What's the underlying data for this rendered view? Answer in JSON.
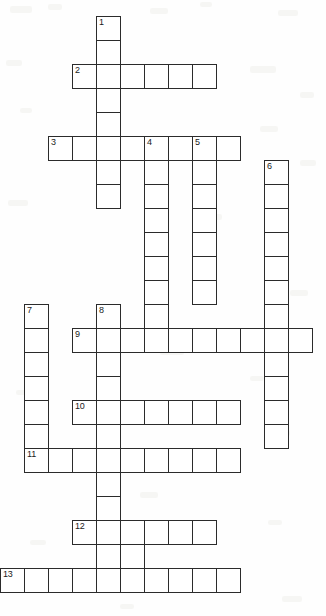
{
  "puzzle": {
    "kind": "crossword-grid",
    "title": "",
    "cell_size_px": 24,
    "origin": {
      "x": 0,
      "y": 16
    },
    "grid_columns": 14,
    "grid_rows": 25,
    "colors": {
      "cell_fill": "#ffffff",
      "cell_border": "#2b2b2b",
      "page_background": "#ffffff",
      "number_text": "#1b1b1b"
    },
    "entries": [
      {
        "number": "1",
        "direction": "down",
        "start_col": 4,
        "start_row": 0,
        "length": 13
      },
      {
        "number": "2",
        "direction": "across",
        "start_col": 3,
        "start_row": 2,
        "length": 6
      },
      {
        "number": "3",
        "direction": "across",
        "start_col": 2,
        "start_row": 5,
        "length": 8
      },
      {
        "number": "4",
        "direction": "down",
        "start_col": 6,
        "start_row": 5,
        "length": 13
      },
      {
        "number": "5",
        "direction": "down",
        "start_col": 8,
        "start_row": 5,
        "length": 7
      },
      {
        "number": "6",
        "direction": "down",
        "start_col": 11,
        "start_row": 6,
        "length": 11
      },
      {
        "number": "7",
        "direction": "down",
        "start_col": 1,
        "start_row": 12,
        "length": 7
      },
      {
        "number": "8",
        "direction": "down",
        "start_col": 4,
        "start_row": 12,
        "length": 10
      },
      {
        "number": "9",
        "direction": "across",
        "start_col": 3,
        "start_row": 13,
        "length": 10
      },
      {
        "number": "10",
        "direction": "across",
        "start_col": 3,
        "start_row": 16,
        "length": 7
      },
      {
        "number": "11",
        "direction": "across",
        "start_col": 1,
        "start_row": 18,
        "length": 9
      },
      {
        "number": "12",
        "direction": "across",
        "start_col": 3,
        "start_row": 21,
        "length": 6
      },
      {
        "number": "13",
        "direction": "across",
        "start_col": 0,
        "start_row": 23,
        "length": 10
      }
    ],
    "cells": [
      {
        "col": 4,
        "row": 0,
        "number": "1"
      },
      {
        "col": 4,
        "row": 1,
        "number": ""
      },
      {
        "col": 3,
        "row": 2,
        "number": "2"
      },
      {
        "col": 4,
        "row": 2,
        "number": ""
      },
      {
        "col": 5,
        "row": 2,
        "number": ""
      },
      {
        "col": 6,
        "row": 2,
        "number": ""
      },
      {
        "col": 7,
        "row": 2,
        "number": ""
      },
      {
        "col": 8,
        "row": 2,
        "number": ""
      },
      {
        "col": 4,
        "row": 3,
        "number": ""
      },
      {
        "col": 4,
        "row": 4,
        "number": ""
      },
      {
        "col": 2,
        "row": 5,
        "number": "3"
      },
      {
        "col": 3,
        "row": 5,
        "number": ""
      },
      {
        "col": 4,
        "row": 5,
        "number": ""
      },
      {
        "col": 5,
        "row": 5,
        "number": ""
      },
      {
        "col": 6,
        "row": 5,
        "number": "4"
      },
      {
        "col": 7,
        "row": 5,
        "number": ""
      },
      {
        "col": 8,
        "row": 5,
        "number": "5"
      },
      {
        "col": 9,
        "row": 5,
        "number": ""
      },
      {
        "col": 4,
        "row": 6,
        "number": ""
      },
      {
        "col": 6,
        "row": 6,
        "number": ""
      },
      {
        "col": 8,
        "row": 6,
        "number": ""
      },
      {
        "col": 11,
        "row": 6,
        "number": "6"
      },
      {
        "col": 4,
        "row": 7,
        "number": ""
      },
      {
        "col": 6,
        "row": 7,
        "number": ""
      },
      {
        "col": 8,
        "row": 7,
        "number": ""
      },
      {
        "col": 11,
        "row": 7,
        "number": ""
      },
      {
        "col": 6,
        "row": 8,
        "number": ""
      },
      {
        "col": 8,
        "row": 8,
        "number": ""
      },
      {
        "col": 11,
        "row": 8,
        "number": ""
      },
      {
        "col": 6,
        "row": 9,
        "number": ""
      },
      {
        "col": 8,
        "row": 9,
        "number": ""
      },
      {
        "col": 11,
        "row": 9,
        "number": ""
      },
      {
        "col": 6,
        "row": 10,
        "number": ""
      },
      {
        "col": 8,
        "row": 10,
        "number": ""
      },
      {
        "col": 11,
        "row": 10,
        "number": ""
      },
      {
        "col": 6,
        "row": 11,
        "number": ""
      },
      {
        "col": 8,
        "row": 11,
        "number": ""
      },
      {
        "col": 11,
        "row": 11,
        "number": ""
      },
      {
        "col": 1,
        "row": 12,
        "number": "7"
      },
      {
        "col": 4,
        "row": 12,
        "number": "8"
      },
      {
        "col": 6,
        "row": 12,
        "number": ""
      },
      {
        "col": 11,
        "row": 12,
        "number": ""
      },
      {
        "col": 3,
        "row": 13,
        "number": "9"
      },
      {
        "col": 4,
        "row": 13,
        "number": ""
      },
      {
        "col": 5,
        "row": 13,
        "number": ""
      },
      {
        "col": 6,
        "row": 13,
        "number": ""
      },
      {
        "col": 7,
        "row": 13,
        "number": ""
      },
      {
        "col": 8,
        "row": 13,
        "number": ""
      },
      {
        "col": 9,
        "row": 13,
        "number": ""
      },
      {
        "col": 10,
        "row": 13,
        "number": ""
      },
      {
        "col": 11,
        "row": 13,
        "number": ""
      },
      {
        "col": 12,
        "row": 13,
        "number": ""
      },
      {
        "col": 1,
        "row": 13,
        "number": ""
      },
      {
        "col": 1,
        "row": 14,
        "number": ""
      },
      {
        "col": 4,
        "row": 14,
        "number": ""
      },
      {
        "col": 11,
        "row": 14,
        "number": ""
      },
      {
        "col": 1,
        "row": 15,
        "number": ""
      },
      {
        "col": 4,
        "row": 15,
        "number": ""
      },
      {
        "col": 11,
        "row": 15,
        "number": ""
      },
      {
        "col": 1,
        "row": 16,
        "number": ""
      },
      {
        "col": 3,
        "row": 16,
        "number": "10"
      },
      {
        "col": 4,
        "row": 16,
        "number": ""
      },
      {
        "col": 5,
        "row": 16,
        "number": ""
      },
      {
        "col": 6,
        "row": 16,
        "number": ""
      },
      {
        "col": 7,
        "row": 16,
        "number": ""
      },
      {
        "col": 8,
        "row": 16,
        "number": ""
      },
      {
        "col": 9,
        "row": 16,
        "number": ""
      },
      {
        "col": 11,
        "row": 16,
        "number": ""
      },
      {
        "col": 1,
        "row": 17,
        "number": ""
      },
      {
        "col": 4,
        "row": 17,
        "number": ""
      },
      {
        "col": 11,
        "row": 17,
        "number": ""
      },
      {
        "col": 1,
        "row": 18,
        "number": "11"
      },
      {
        "col": 2,
        "row": 18,
        "number": ""
      },
      {
        "col": 3,
        "row": 18,
        "number": ""
      },
      {
        "col": 4,
        "row": 18,
        "number": ""
      },
      {
        "col": 5,
        "row": 18,
        "number": ""
      },
      {
        "col": 6,
        "row": 18,
        "number": ""
      },
      {
        "col": 7,
        "row": 18,
        "number": ""
      },
      {
        "col": 8,
        "row": 18,
        "number": ""
      },
      {
        "col": 9,
        "row": 18,
        "number": ""
      },
      {
        "col": 4,
        "row": 19,
        "number": ""
      },
      {
        "col": 4,
        "row": 20,
        "number": ""
      },
      {
        "col": 3,
        "row": 21,
        "number": "12"
      },
      {
        "col": 4,
        "row": 21,
        "number": ""
      },
      {
        "col": 5,
        "row": 21,
        "number": ""
      },
      {
        "col": 6,
        "row": 21,
        "number": ""
      },
      {
        "col": 7,
        "row": 21,
        "number": ""
      },
      {
        "col": 8,
        "row": 21,
        "number": ""
      },
      {
        "col": 4,
        "row": 22,
        "number": ""
      },
      {
        "col": 5,
        "row": 22,
        "number": ""
      },
      {
        "col": 0,
        "row": 23,
        "number": "13"
      },
      {
        "col": 1,
        "row": 23,
        "number": ""
      },
      {
        "col": 2,
        "row": 23,
        "number": ""
      },
      {
        "col": 3,
        "row": 23,
        "number": ""
      },
      {
        "col": 4,
        "row": 23,
        "number": ""
      },
      {
        "col": 5,
        "row": 23,
        "number": ""
      },
      {
        "col": 6,
        "row": 23,
        "number": ""
      },
      {
        "col": 7,
        "row": 23,
        "number": ""
      },
      {
        "col": 8,
        "row": 23,
        "number": ""
      },
      {
        "col": 9,
        "row": 23,
        "number": ""
      }
    ],
    "background_specks": [
      {
        "x": 10,
        "y": 6,
        "w": 22,
        "h": 7
      },
      {
        "x": 48,
        "y": 4,
        "w": 14,
        "h": 6
      },
      {
        "x": 150,
        "y": 8,
        "w": 18,
        "h": 6
      },
      {
        "x": 200,
        "y": 2,
        "w": 12,
        "h": 5
      },
      {
        "x": 278,
        "y": 10,
        "w": 20,
        "h": 6
      },
      {
        "x": 6,
        "y": 60,
        "w": 16,
        "h": 6
      },
      {
        "x": 250,
        "y": 66,
        "w": 26,
        "h": 7
      },
      {
        "x": 300,
        "y": 92,
        "w": 14,
        "h": 6
      },
      {
        "x": 20,
        "y": 108,
        "w": 12,
        "h": 5
      },
      {
        "x": 260,
        "y": 126,
        "w": 18,
        "h": 6
      },
      {
        "x": 300,
        "y": 160,
        "w": 16,
        "h": 6
      },
      {
        "x": 8,
        "y": 200,
        "w": 20,
        "h": 6
      },
      {
        "x": 200,
        "y": 214,
        "w": 22,
        "h": 6
      },
      {
        "x": 150,
        "y": 268,
        "w": 16,
        "h": 6
      },
      {
        "x": 290,
        "y": 290,
        "w": 18,
        "h": 6
      },
      {
        "x": 160,
        "y": 348,
        "w": 24,
        "h": 7
      },
      {
        "x": 250,
        "y": 376,
        "w": 14,
        "h": 5
      },
      {
        "x": 16,
        "y": 390,
        "w": 12,
        "h": 5
      },
      {
        "x": 270,
        "y": 430,
        "w": 20,
        "h": 6
      },
      {
        "x": 140,
        "y": 492,
        "w": 18,
        "h": 6
      },
      {
        "x": 268,
        "y": 520,
        "w": 14,
        "h": 5
      },
      {
        "x": 30,
        "y": 540,
        "w": 16,
        "h": 5
      },
      {
        "x": 282,
        "y": 596,
        "w": 20,
        "h": 6
      },
      {
        "x": 120,
        "y": 604,
        "w": 14,
        "h": 5
      }
    ]
  }
}
